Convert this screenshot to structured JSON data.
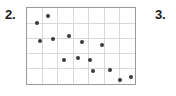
{
  "page": {
    "background_color": "#ffffff",
    "width": 176,
    "height": 96
  },
  "items": [
    {
      "number": "2."
    },
    {
      "number": "3."
    }
  ],
  "chart_data": {
    "type": "scatter",
    "title": "",
    "xlabel": "",
    "ylabel": "",
    "grid": true,
    "legend": false,
    "x_tick_labels": [],
    "y_tick_labels": [],
    "xlim": [
      0,
      7
    ],
    "ylim": [
      0,
      5
    ],
    "grid_columns": 7,
    "grid_rows": 5,
    "frame_color": "#9a9a9a",
    "grid_color": "#cfcfcf",
    "point_color": "#3a3a3a",
    "point_radius_px": 2,
    "n_points": 14,
    "relationship": "negative",
    "points": [
      {
        "x": 0.38,
        "y": 4.05
      },
      {
        "x": 1.34,
        "y": 4.55
      },
      {
        "x": 0.57,
        "y": 3.0
      },
      {
        "x": 1.66,
        "y": 3.15
      },
      {
        "x": 2.68,
        "y": 3.3
      },
      {
        "x": 3.5,
        "y": 2.95
      },
      {
        "x": 4.78,
        "y": 2.75
      },
      {
        "x": 2.36,
        "y": 1.8
      },
      {
        "x": 3.25,
        "y": 1.95
      },
      {
        "x": 4.02,
        "y": 1.8
      },
      {
        "x": 4.2,
        "y": 1.05
      },
      {
        "x": 5.3,
        "y": 1.1
      },
      {
        "x": 5.93,
        "y": 0.45
      },
      {
        "x": 6.63,
        "y": 0.65
      }
    ],
    "points_px": [
      {
        "left": 10,
        "top": 15
      },
      {
        "left": 21,
        "top": 8
      },
      {
        "left": 13,
        "top": 33
      },
      {
        "left": 26,
        "top": 31
      },
      {
        "left": 42,
        "top": 28
      },
      {
        "left": 55,
        "top": 34
      },
      {
        "left": 75,
        "top": 37
      },
      {
        "left": 37,
        "top": 52
      },
      {
        "left": 51,
        "top": 50
      },
      {
        "left": 63,
        "top": 52
      },
      {
        "left": 66,
        "top": 63
      },
      {
        "left": 83,
        "top": 62
      },
      {
        "left": 93,
        "top": 72
      },
      {
        "left": 104,
        "top": 69
      }
    ]
  }
}
